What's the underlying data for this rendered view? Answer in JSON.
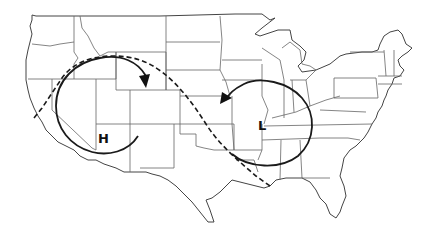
{
  "map": {
    "type": "outline map",
    "region": "United States (contiguous 48 states)",
    "background_color": "#ffffff",
    "outline_color": "#555555",
    "annotation_color": "#1a1a1a"
  },
  "pressure_systems": [
    {
      "id": "high",
      "label": "H",
      "meaning": "high pressure",
      "location": "Great Basin / Nevada-Utah",
      "rotation": "clockwise",
      "label_pos": [
        104,
        139
      ]
    },
    {
      "id": "low",
      "label": "L",
      "meaning": "low pressure",
      "location": "Missouri / Illinois",
      "rotation": "counterclockwise",
      "label_pos": [
        265,
        125
      ]
    }
  ],
  "paths": [
    {
      "id": "dashed-track",
      "style": "dashed",
      "description": "track from northern California coast arcing over Idaho/Wyoming down to Louisiana"
    }
  ]
}
